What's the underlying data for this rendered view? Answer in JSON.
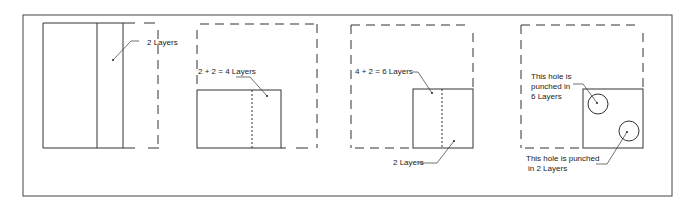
{
  "diagram": {
    "panels": [
      {
        "id": 1,
        "labels": {
          "layers": "2 Layers"
        }
      },
      {
        "id": 2,
        "labels": {
          "layers": "2 + 2 = 4 Layers"
        }
      },
      {
        "id": 3,
        "labels": {
          "top": "4 + 2 = 6  Layers",
          "bottom": "2 Layers"
        }
      },
      {
        "id": 4,
        "labels": {
          "hole1_line1": "This hole is",
          "hole1_line2": "punched in",
          "hole1_line3": "6 Layers",
          "hole2_line1": "This hole is punched",
          "hole2_line2": "in 2 Layers"
        }
      }
    ],
    "colors": {
      "stroke": "#333333",
      "background": "#ffffff",
      "text": "#222222"
    }
  }
}
